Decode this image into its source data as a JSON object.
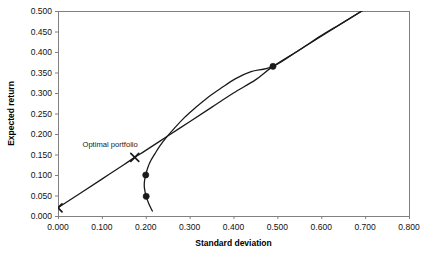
{
  "chart_data": {
    "type": "line",
    "title": "",
    "xlabel": "Standard deviation",
    "ylabel": "Expected return",
    "xlim": [
      0.0,
      0.8
    ],
    "ylim": [
      0.0,
      0.5
    ],
    "xticks": [
      "0.000",
      "0.100",
      "0.200",
      "0.300",
      "0.400",
      "0.500",
      "0.600",
      "0.700",
      "0.800"
    ],
    "yticks": [
      "0.000",
      "0.050",
      "0.100",
      "0.150",
      "0.200",
      "0.250",
      "0.300",
      "0.350",
      "0.400",
      "0.450",
      "0.500"
    ],
    "xtick_values": [
      0.0,
      0.1,
      0.2,
      0.3,
      0.4,
      0.5,
      0.6,
      0.7,
      0.8
    ],
    "ytick_values": [
      0.0,
      0.05,
      0.1,
      0.15,
      0.2,
      0.25,
      0.3,
      0.35,
      0.4,
      0.45,
      0.5
    ],
    "grid": false,
    "legend": "none",
    "line_color": "#1a1a1a",
    "axis_color": "#808080",
    "marker_color": "#1a1a1a",
    "series": [
      {
        "name": "Capital market line",
        "type": "line",
        "points": [
          [
            0.0,
            0.02
          ],
          [
            0.05,
            0.055
          ],
          [
            0.1,
            0.09
          ],
          [
            0.15,
            0.125
          ],
          [
            0.175,
            0.143
          ],
          [
            0.2,
            0.16
          ],
          [
            0.25,
            0.195
          ],
          [
            0.3,
            0.23
          ],
          [
            0.35,
            0.265
          ],
          [
            0.4,
            0.3
          ],
          [
            0.45,
            0.332
          ],
          [
            0.49,
            0.365
          ],
          [
            0.55,
            0.405
          ],
          [
            0.6,
            0.44
          ],
          [
            0.65,
            0.472
          ],
          [
            0.7,
            0.505
          ]
        ]
      },
      {
        "name": "Efficient frontier",
        "type": "line",
        "points": [
          [
            0.215,
            0.012
          ],
          [
            0.207,
            0.03
          ],
          [
            0.201,
            0.048
          ],
          [
            0.197,
            0.068
          ],
          [
            0.197,
            0.084
          ],
          [
            0.2,
            0.1
          ],
          [
            0.204,
            0.116
          ],
          [
            0.211,
            0.134
          ],
          [
            0.221,
            0.152
          ],
          [
            0.233,
            0.172
          ],
          [
            0.248,
            0.193
          ],
          [
            0.266,
            0.215
          ],
          [
            0.288,
            0.24
          ],
          [
            0.312,
            0.263
          ],
          [
            0.34,
            0.288
          ],
          [
            0.372,
            0.312
          ],
          [
            0.405,
            0.335
          ],
          [
            0.44,
            0.352
          ],
          [
            0.49,
            0.365
          ],
          [
            0.55,
            0.405
          ],
          [
            0.62,
            0.452
          ],
          [
            0.7,
            0.505
          ]
        ]
      }
    ],
    "markers": [
      {
        "name": "risk-free-asset",
        "x": 0.0,
        "y": 0.02,
        "shape": "x"
      },
      {
        "name": "optimal-portfolio",
        "x": 0.175,
        "y": 0.143,
        "shape": "x"
      },
      {
        "name": "asset-low-risk",
        "x": 0.201,
        "y": 0.048,
        "shape": "circle"
      },
      {
        "name": "asset-mid-risk",
        "x": 0.2,
        "y": 0.1,
        "shape": "circle"
      },
      {
        "name": "asset-high-risk",
        "x": 0.49,
        "y": 0.365,
        "shape": "circle"
      }
    ],
    "annotations": [
      {
        "name": "optimal-portfolio-label",
        "text": "Optimal portfolio",
        "x": 0.175,
        "y": 0.175
      }
    ]
  }
}
